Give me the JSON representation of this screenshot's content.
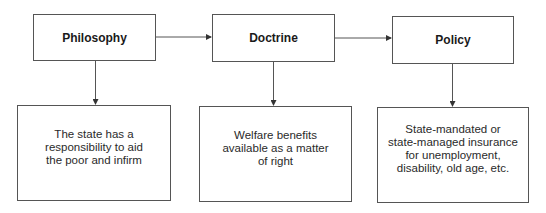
{
  "diagram": {
    "nodes": {
      "philosophy": {
        "label": "Philosophy"
      },
      "doctrine": {
        "label": "Doctrine"
      },
      "policy": {
        "label": "Policy"
      }
    },
    "details": {
      "philosophy": {
        "text": "The state has a\nresponsibility to aid\nthe poor and infirm"
      },
      "doctrine": {
        "text": "Welfare benefits\navailable as a matter\nof right"
      },
      "policy": {
        "text": "State-mandated or\nstate-managed insurance\nfor unemployment,\ndisability, old age, etc."
      }
    },
    "edges": [
      {
        "from": "Philosophy",
        "to": "Doctrine"
      },
      {
        "from": "Doctrine",
        "to": "Policy"
      },
      {
        "from": "Philosophy",
        "to": "The state has a responsibility to aid the poor and infirm"
      },
      {
        "from": "Doctrine",
        "to": "Welfare benefits available as a matter of right"
      },
      {
        "from": "Policy",
        "to": "State-mandated or state-managed insurance for unemployment, disability, old age, etc."
      }
    ],
    "colors": {
      "stroke": "#555555",
      "text": "#222222",
      "background": "#ffffff"
    }
  }
}
